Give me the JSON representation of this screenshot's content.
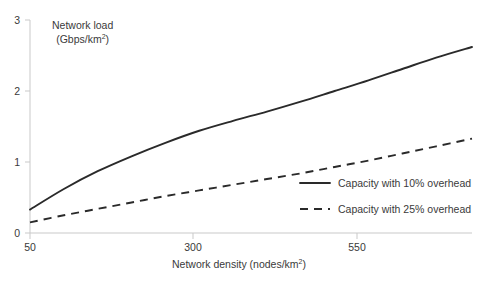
{
  "chart_data": {
    "type": "line",
    "title": "",
    "xlabel": "Network density (nodes/km²)",
    "ylabel": "Network load (Gbps/km²)",
    "ylabel_line1": "Network load",
    "ylabel_line2_prefix": "(Gbps/km",
    "ylabel_line2_exp": "2",
    "ylabel_line2_suffix": ")",
    "xlabel_prefix": "Network density (nodes/km",
    "xlabel_exp": "2",
    "xlabel_suffix": ")",
    "xlim": [
      50,
      703
    ],
    "ylim": [
      0,
      3
    ],
    "xticks": [
      50,
      300,
      550
    ],
    "xtick_labels": [
      "50",
      "300",
      "550"
    ],
    "yticks": [
      0,
      1,
      2,
      3
    ],
    "ytick_labels": [
      "0",
      "1",
      "2",
      "3"
    ],
    "grid": false,
    "legend_position": "inside-right",
    "x": [
      50,
      100,
      150,
      200,
      250,
      300,
      350,
      400,
      450,
      500,
      550,
      600,
      650,
      703
    ],
    "series": [
      {
        "name": "Capacity with 10% overhead",
        "style": "solid",
        "color": "#2a2a2a",
        "values": [
          0.33,
          0.62,
          0.87,
          1.08,
          1.27,
          1.44,
          1.58,
          1.71,
          1.85,
          2.0,
          2.15,
          2.31,
          2.47,
          2.62
        ]
      },
      {
        "name": "Capacity with 25% overhead",
        "style": "dashed",
        "color": "#2a2a2a",
        "values": [
          0.15,
          0.25,
          0.34,
          0.43,
          0.52,
          0.6,
          0.68,
          0.76,
          0.84,
          0.93,
          1.02,
          1.12,
          1.22,
          1.33
        ]
      }
    ]
  },
  "legend": {
    "entries": [
      {
        "label": "Capacity with 10% overhead",
        "style": "solid"
      },
      {
        "label": "Capacity with 25% overhead",
        "style": "dashed"
      }
    ]
  },
  "colors": {
    "line": "#2a2a2a",
    "axis": "#c9c9c9",
    "text": "#3a3a3a",
    "background": "#ffffff"
  }
}
